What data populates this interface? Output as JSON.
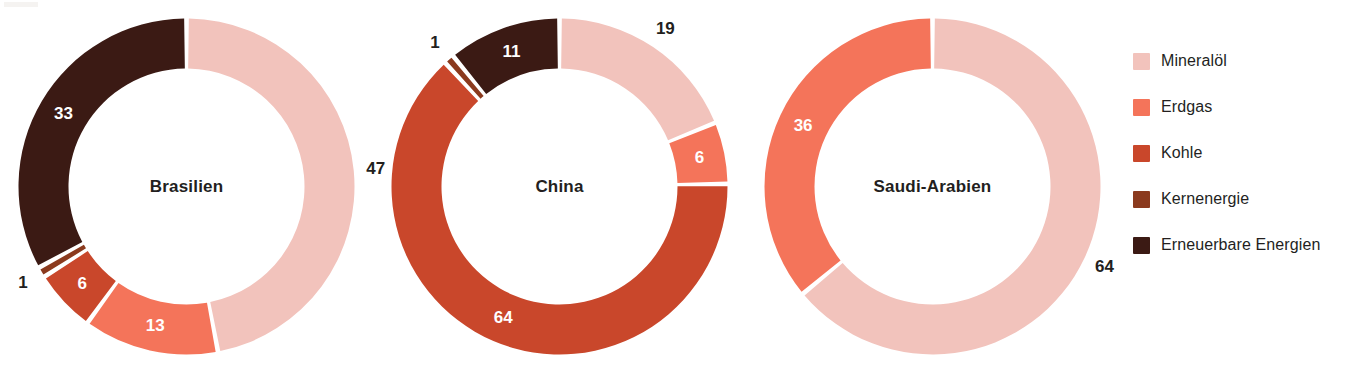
{
  "chart_data": {
    "type": "pie",
    "title": "",
    "subtitle": "",
    "variant": "donut",
    "units": "percent",
    "legend_position": "right",
    "grid": false,
    "categories": [
      "Mineralöl",
      "Erdgas",
      "Kohle",
      "Kernenergie",
      "Erneuerbare Energien"
    ],
    "colors": [
      "#F2C3BC",
      "#F4745A",
      "#C9472B",
      "#8B3A1E",
      "#3B1A14"
    ],
    "charts": [
      {
        "name": "Brasilien",
        "center_label": "Brasilien",
        "slices": [
          {
            "category": "Mineralöl",
            "value": 47,
            "label": "47",
            "label_color": "dark"
          },
          {
            "category": "Erdgas",
            "value": 13,
            "label": "13",
            "label_color": "white"
          },
          {
            "category": "Kohle",
            "value": 6,
            "label": "6",
            "label_color": "white"
          },
          {
            "category": "Kernenergie",
            "value": 1,
            "label": "1",
            "label_color": "dark"
          },
          {
            "category": "Erneuerbare Energien",
            "value": 33,
            "label": "33",
            "label_color": "white"
          }
        ]
      },
      {
        "name": "China",
        "center_label": "China",
        "slices": [
          {
            "category": "Mineralöl",
            "value": 19,
            "label": "19",
            "label_color": "dark"
          },
          {
            "category": "Erdgas",
            "value": 6,
            "label": "6",
            "label_color": "white"
          },
          {
            "category": "Kohle",
            "value": 64,
            "label": "64",
            "label_color": "white"
          },
          {
            "category": "Kernenergie",
            "value": 1,
            "label": "1",
            "label_color": "dark"
          },
          {
            "category": "Erneuerbare Energien",
            "value": 11,
            "label": "11",
            "label_color": "white"
          }
        ]
      },
      {
        "name": "Saudi-Arabien",
        "center_label": "Saudi-Arabien",
        "slices": [
          {
            "category": "Mineralöl",
            "value": 64,
            "label": "64",
            "label_color": "dark"
          },
          {
            "category": "Erdgas",
            "value": 36,
            "label": "36",
            "label_color": "white"
          }
        ]
      }
    ]
  },
  "legend": {
    "items": [
      {
        "label": "Mineralöl",
        "color": "#F2C3BC"
      },
      {
        "label": "Erdgas",
        "color": "#F4745A"
      },
      {
        "label": "Kohle",
        "color": "#C9472B"
      },
      {
        "label": "Kernenergie",
        "color": "#8B3A1E"
      },
      {
        "label": "Erneuerbare Energien",
        "color": "#3B1A14"
      }
    ]
  }
}
